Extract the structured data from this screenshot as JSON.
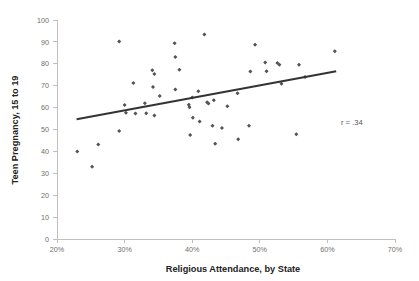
{
  "chart_data": {
    "type": "scatter",
    "title": "",
    "xlabel": "Religious Attendance, by State",
    "ylabel": "Teen Pregnancy, 15 to 19",
    "xlim": [
      20,
      70
    ],
    "ylim": [
      0,
      100
    ],
    "xticks": [
      20,
      30,
      40,
      50,
      60,
      70
    ],
    "xtick_labels": [
      "20%",
      "30%",
      "40%",
      "50%",
      "60%",
      "70%"
    ],
    "yticks": [
      0,
      10,
      20,
      30,
      40,
      50,
      60,
      70,
      80,
      90,
      100
    ],
    "ytick_labels": [
      "0",
      "10",
      "20",
      "30",
      "40",
      "50",
      "60",
      "70",
      "80",
      "90",
      "100"
    ],
    "grid": false,
    "legend": null,
    "annotations": [
      {
        "text": "r = .34",
        "x": 62.0,
        "y": 52.0
      }
    ],
    "series": [
      {
        "name": "States",
        "marker": "diamond",
        "color": "#565656",
        "points": [
          [
            23.0,
            39.9
          ],
          [
            25.2,
            33.0
          ],
          [
            26.1,
            43.1
          ],
          [
            29.2,
            90.2
          ],
          [
            29.2,
            49.3
          ],
          [
            30.0,
            61.2
          ],
          [
            30.2,
            57.6
          ],
          [
            31.3,
            71.2
          ],
          [
            31.6,
            57.3
          ],
          [
            33.0,
            62.0
          ],
          [
            33.2,
            57.4
          ],
          [
            34.1,
            77.1
          ],
          [
            34.2,
            69.4
          ],
          [
            34.4,
            75.3
          ],
          [
            34.4,
            56.4
          ],
          [
            35.2,
            65.3
          ],
          [
            37.4,
            89.4
          ],
          [
            37.5,
            83.1
          ],
          [
            37.5,
            68.3
          ],
          [
            38.1,
            77.3
          ],
          [
            39.5,
            61.3
          ],
          [
            39.6,
            60.2
          ],
          [
            39.7,
            47.5
          ],
          [
            40.0,
            64.6
          ],
          [
            40.1,
            55.4
          ],
          [
            40.9,
            67.5
          ],
          [
            41.1,
            53.6
          ],
          [
            41.8,
            93.4
          ],
          [
            42.2,
            62.4
          ],
          [
            42.4,
            61.9
          ],
          [
            43.0,
            51.7
          ],
          [
            43.2,
            63.4
          ],
          [
            43.4,
            43.5
          ],
          [
            44.4,
            50.7
          ],
          [
            45.2,
            60.6
          ],
          [
            46.7,
            66.6
          ],
          [
            46.8,
            45.5
          ],
          [
            48.4,
            51.7
          ],
          [
            48.6,
            76.5
          ],
          [
            49.3,
            88.7
          ],
          [
            50.8,
            80.6
          ],
          [
            51.0,
            76.6
          ],
          [
            52.6,
            80.4
          ],
          [
            52.9,
            79.6
          ],
          [
            53.2,
            70.9
          ],
          [
            55.4,
            47.8
          ],
          [
            55.8,
            79.6
          ],
          [
            56.7,
            74.0
          ],
          [
            61.1,
            85.7
          ]
        ]
      }
    ],
    "trend_line": {
      "name": "linear-fit",
      "color": "#333333",
      "x_start": 22.9,
      "y_start": 54.7,
      "x_end": 61.3,
      "y_end": 76.6,
      "r": ".34"
    }
  },
  "axes": {
    "x_axis_title": "Religious Attendance, by State",
    "y_axis_title": "Teen Pregnancy, 15 to 19"
  }
}
